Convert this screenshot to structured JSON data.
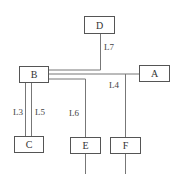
{
  "nodes": {
    "A": {
      "label": "A"
    },
    "B": {
      "label": "B"
    },
    "C": {
      "label": "C"
    },
    "D": {
      "label": "D"
    },
    "E": {
      "label": "E"
    },
    "F": {
      "label": "F"
    }
  },
  "links": {
    "L3": "L3",
    "L4": "L4",
    "L5": "L5",
    "L6": "L6",
    "L7": "L7"
  },
  "colors": {
    "line": "#777777",
    "box_border": "#555555"
  }
}
